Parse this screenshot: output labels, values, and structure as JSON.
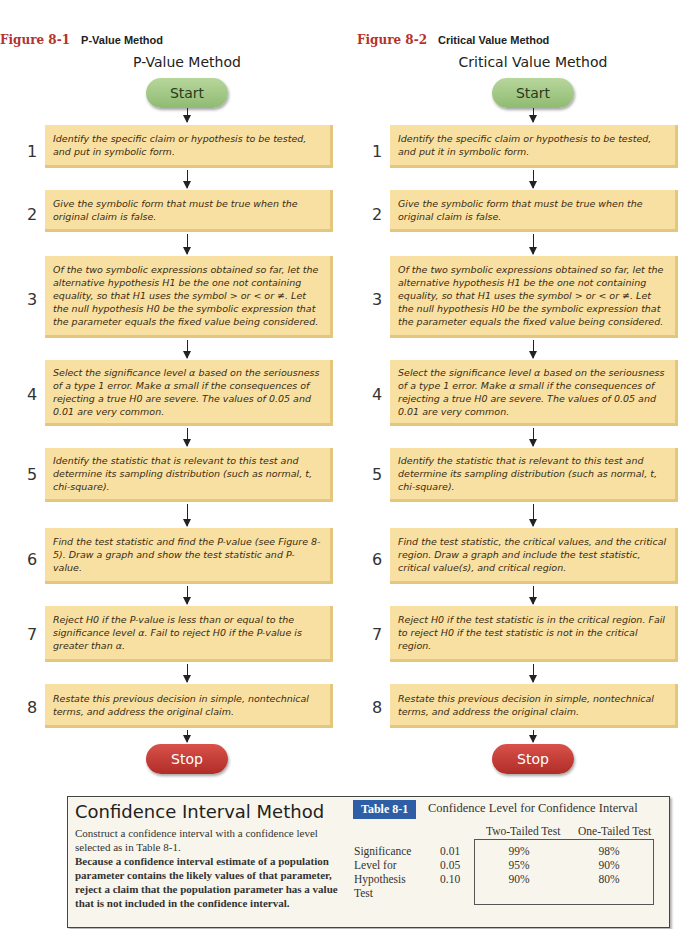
{
  "figures": [
    {
      "number": "Figure 8-1",
      "caption": "P-Value Method",
      "flow_title": "P-Value Method",
      "start_label": "Start",
      "stop_label": "Stop",
      "steps": [
        {
          "n": "1",
          "text": "Identify the specific claim or hypothesis to be tested, and put in symbolic form."
        },
        {
          "n": "2",
          "text": "Give the symbolic form that must be true when the original claim is false."
        },
        {
          "n": "3",
          "text": "Of the two symbolic expressions obtained so far, let the alternative hypothesis H1 be the one not containing equality, so that H1 uses the symbol > or < or ≠. Let the null hypothesis H0 be the symbolic expression that the parameter equals the fixed value being considered."
        },
        {
          "n": "4",
          "text": "Select the significance level α based on the seriousness of a type 1 error. Make α small if the consequences of rejecting a true H0 are severe. The values of 0.05 and 0.01 are very common."
        },
        {
          "n": "5",
          "text": "Identify the statistic that is relevant to this test and determine its sampling distribution (such as normal, t, chi-square)."
        },
        {
          "n": "6",
          "text": "Find the test statistic and find the P-value (see Figure 8-5). Draw a graph and show the test statistic and P-value."
        },
        {
          "n": "7",
          "text": "Reject H0 if the P-value is less than or equal to the significance level α. Fail to reject H0 if the P-value is greater than α."
        },
        {
          "n": "8",
          "text": "Restate this previous decision in simple, nontechnical terms, and address the original claim."
        }
      ]
    },
    {
      "number": "Figure 8-2",
      "caption": "Critical Value Method",
      "flow_title": "Critical Value Method",
      "start_label": "Start",
      "stop_label": "Stop",
      "steps": [
        {
          "n": "1",
          "text": "Identify the specific claim or hypothesis to be tested, and put it in symbolic form."
        },
        {
          "n": "2",
          "text": "Give the symbolic form that must be true when the original claim is false."
        },
        {
          "n": "3",
          "text": "Of the two symbolic expressions obtained so far, let the alternative hypothesis H1 be the one not containing equality, so that H1 uses the symbol > or < or ≠. Let the null hypothesis H0 be the symbolic expression that the parameter equals the fixed value being considered."
        },
        {
          "n": "4",
          "text": "Select the significance level α based on the seriousness of a type 1 error. Make α small if the consequences of rejecting a true H0 are severe. The values of 0.05 and 0.01 are very common."
        },
        {
          "n": "5",
          "text": "Identify the statistic that is relevant to this test and determine its sampling distribution (such as normal, t, chi-square)."
        },
        {
          "n": "6",
          "text": "Find the test statistic, the critical values, and the critical region. Draw a graph and include the test statistic, critical value(s), and critical region."
        },
        {
          "n": "7",
          "text": "Reject H0 if the test statistic is in the critical region. Fail to reject H0 if the test statistic is not in the critical region."
        },
        {
          "n": "8",
          "text": "Restate this previous decision in simple, nontechnical terms, and address the original claim."
        }
      ]
    }
  ],
  "confidence_interval": {
    "title": "Confidence Interval Method",
    "intro": "Construct a confidence interval with a confidence level selected as in Table 8-1.",
    "bold_text": "Because a confidence interval estimate of a population parameter contains the likely values of that parameter, reject a claim that the population parameter has a value that is not included in the confidence interval."
  },
  "table": {
    "badge": "Table 8-1",
    "caption": "Confidence Level for Confidence Interval",
    "col_headers": [
      "Two-Tailed Test",
      "One-Tailed Test"
    ],
    "row_label_lines": [
      "Significance",
      "Level for",
      "Hypothesis",
      "Test"
    ],
    "rows": [
      {
        "sig": "0.01",
        "two": "99%",
        "one": "98%"
      },
      {
        "sig": "0.05",
        "two": "95%",
        "one": "90%"
      },
      {
        "sig": "0.10",
        "two": "90%",
        "one": "80%"
      }
    ]
  }
}
